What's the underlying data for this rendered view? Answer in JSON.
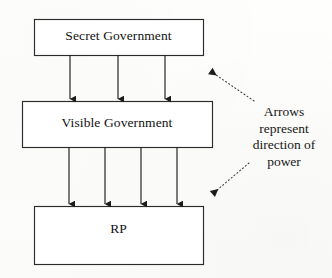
{
  "diagram": {
    "type": "block-flow",
    "background_color": "#fdfdfc",
    "stroke_color": "#2b2b2b",
    "text_color": "#121212",
    "boxes": [
      {
        "id": "secret-government",
        "label": "Secret Government",
        "x": 34,
        "y": 19,
        "width": 169,
        "height": 36
      },
      {
        "id": "visible-government",
        "label": "Visible Government",
        "x": 22,
        "y": 101,
        "width": 190,
        "height": 46
      },
      {
        "id": "rp",
        "label": "RP",
        "x": 34,
        "y": 206,
        "width": 169,
        "height": 58
      }
    ],
    "flows": [
      {
        "id": "secret-to-visible",
        "from": "secret-government",
        "to": "visible-government",
        "arrow_count": 3,
        "arrow_x": [
          70,
          118,
          165
        ],
        "y_start": 55,
        "y_end": 101
      },
      {
        "id": "visible-to-rp",
        "from": "visible-government",
        "to": "rp",
        "arrow_count": 4,
        "arrow_x": [
          69,
          105,
          141,
          177
        ],
        "y_start": 147,
        "y_end": 206
      }
    ],
    "callout": {
      "id": "arrow-meaning-callout",
      "lines": [
        "Arrows",
        "represent",
        "direction of",
        "power"
      ],
      "full_text": "Arrows represent direction of power",
      "leaders": [
        {
          "id": "leader-upper",
          "style": "dotted",
          "from_x": 254,
          "from_y": 101,
          "to_x": 206,
          "to_y": 68,
          "arrowhead": "to"
        },
        {
          "id": "leader-lower",
          "style": "dotted",
          "from_x": 249,
          "from_y": 163,
          "to_x": 208,
          "to_y": 197,
          "arrowhead": "to"
        }
      ]
    }
  }
}
